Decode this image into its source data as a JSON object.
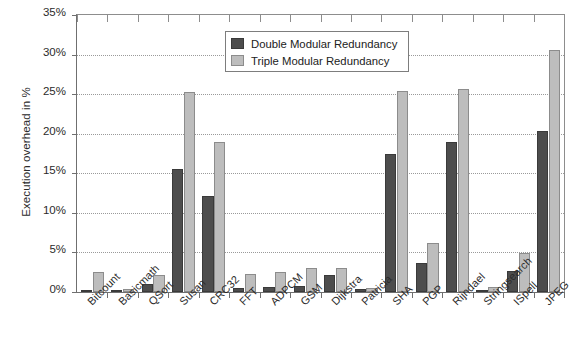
{
  "chart_data": {
    "type": "bar",
    "title": "",
    "subtitle": "",
    "xlabel": "",
    "ylabel": "Execution overhead in %",
    "ylim": [
      0,
      35
    ],
    "ytick_labels": [
      "0%",
      "5%",
      "10%",
      "15%",
      "20%",
      "25%",
      "30%",
      "35%"
    ],
    "ytick_values": [
      0,
      5,
      10,
      15,
      20,
      25,
      30,
      35
    ],
    "grid": true,
    "grid_axis": "y",
    "legend_position": "upper-center",
    "categories": [
      "Bitcount",
      "Basicmath",
      "QSort",
      "Susan",
      "CRC32",
      "FFT",
      "ADPCM",
      "GSM",
      "Dijkstra",
      "Patricia",
      "SHA",
      "PGP",
      "Rijndael",
      "Stringsearch",
      "ISpell",
      "JPEG"
    ],
    "series": [
      {
        "name": "Double Modular Redundancy",
        "color": "#4d4d4d",
        "values": [
          0.25,
          0.1,
          1.0,
          15.6,
          12.1,
          0.5,
          0.6,
          0.7,
          2.2,
          0.35,
          17.4,
          3.7,
          18.9,
          0.3,
          2.6,
          20.3
        ]
      },
      {
        "name": "Triple Modular Redundancy",
        "color": "#bdbdbd",
        "values": [
          2.5,
          0.4,
          2.2,
          25.3,
          18.9,
          2.3,
          2.5,
          3.0,
          3.0,
          0.5,
          25.4,
          6.2,
          25.7,
          0.6,
          4.9,
          30.6
        ]
      }
    ]
  },
  "legend": {
    "entries": [
      {
        "label": "Double Modular Redundancy",
        "swatch": "dmr"
      },
      {
        "label": "Triple Modular Redundancy",
        "swatch": "tmr"
      }
    ]
  }
}
